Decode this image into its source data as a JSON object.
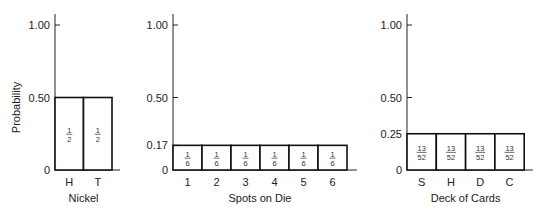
{
  "chart_data": [
    {
      "type": "bar",
      "title": "",
      "xlabel": "Nickel",
      "ylabel": "Probability",
      "categories": [
        "H",
        "T"
      ],
      "values": [
        0.5,
        0.5
      ],
      "bar_labels": [
        {
          "num": "1",
          "den": "2"
        },
        {
          "num": "1",
          "den": "2"
        }
      ],
      "yticks": [
        "0",
        "0.50",
        "1.00"
      ],
      "ylim": [
        0,
        1.0
      ],
      "grid": false
    },
    {
      "type": "bar",
      "title": "",
      "xlabel": "Spots on Die",
      "ylabel": "",
      "categories": [
        "1",
        "2",
        "3",
        "4",
        "5",
        "6"
      ],
      "values": [
        0.17,
        0.17,
        0.17,
        0.17,
        0.17,
        0.17
      ],
      "bar_labels": [
        {
          "num": "1",
          "den": "6"
        },
        {
          "num": "1",
          "den": "6"
        },
        {
          "num": "1",
          "den": "6"
        },
        {
          "num": "1",
          "den": "6"
        },
        {
          "num": "1",
          "den": "6"
        },
        {
          "num": "1",
          "den": "6"
        }
      ],
      "yticks": [
        "0",
        "0.17",
        "0.50",
        "1.00"
      ],
      "ylim": [
        0,
        1.0
      ],
      "grid": false
    },
    {
      "type": "bar",
      "title": "",
      "xlabel": "Deck of Cards",
      "ylabel": "",
      "categories": [
        "S",
        "H",
        "D",
        "C"
      ],
      "values": [
        0.25,
        0.25,
        0.25,
        0.25
      ],
      "bar_labels": [
        {
          "num": "13",
          "den": "52"
        },
        {
          "num": "13",
          "den": "52"
        },
        {
          "num": "13",
          "den": "52"
        },
        {
          "num": "13",
          "den": "52"
        }
      ],
      "yticks": [
        "0",
        "0.25",
        "0.50",
        "1.00"
      ],
      "ylim": [
        0,
        1.0
      ],
      "grid": false
    }
  ]
}
